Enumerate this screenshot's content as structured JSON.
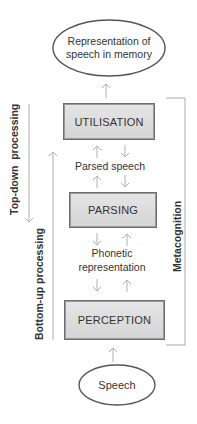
{
  "diagram": {
    "top_node": {
      "line1": "Representation of",
      "line2": "speech in memory"
    },
    "stages": [
      {
        "label": "UTILISATION"
      },
      {
        "label": "PARSING"
      },
      {
        "label": "PERCEPTION"
      }
    ],
    "intermediates": [
      {
        "line1": "Parsed speech"
      },
      {
        "line1": "Phonetic",
        "line2": "representation"
      }
    ],
    "bottom_node": {
      "label": "Speech"
    },
    "side_labels": {
      "top_down": "Top-down  processing",
      "bottom_up": "Bottom-up processing",
      "metacognition": "Metacognition"
    },
    "colors": {
      "box_fill": "#dcdcdc",
      "box_border": "#6e6e6e",
      "arrow": "#b0b0b0",
      "text": "#333333"
    }
  }
}
